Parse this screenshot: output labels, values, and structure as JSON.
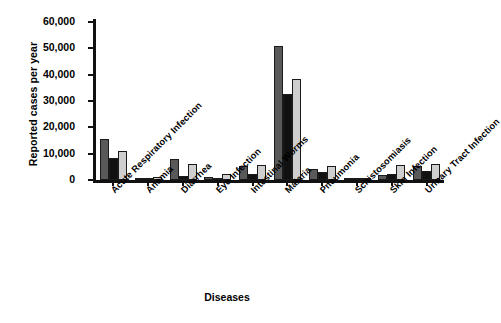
{
  "chart_data": {
    "type": "bar",
    "title": "",
    "xlabel": "Diseases",
    "ylabel": "Reported cases per year",
    "ylim": [
      0,
      60000
    ],
    "yticks": [
      0,
      10000,
      20000,
      30000,
      40000,
      50000,
      60000
    ],
    "ytick_labels": [
      "0",
      "10,000",
      "20,000",
      "30,000",
      "40,000",
      "50,000",
      "60,000"
    ],
    "grid": false,
    "legend": "none",
    "categories": [
      "Acute Respiratory Infection",
      "Anemia",
      "Diarrhea",
      "Eye Infection",
      "Intestinal Worms",
      "Malaria",
      "Pneumonia",
      "Schistosomiasis",
      "Skin Infection",
      "Urinary Tract Infection"
    ],
    "series": [
      {
        "name": "series-1",
        "color": "#595959",
        "values": [
          15500,
          600,
          8000,
          1200,
          5300,
          51000,
          4000,
          400,
          1800,
          5500
        ]
      },
      {
        "name": "series-2",
        "color": "#111111",
        "values": [
          8300,
          900,
          1500,
          400,
          2200,
          32500,
          3000,
          300,
          2200,
          3500
        ]
      },
      {
        "name": "series-3",
        "color": "#cfcfcf",
        "values": [
          11000,
          1300,
          6000,
          2200,
          5700,
          38500,
          5500,
          500,
          5800,
          6200
        ]
      }
    ]
  }
}
